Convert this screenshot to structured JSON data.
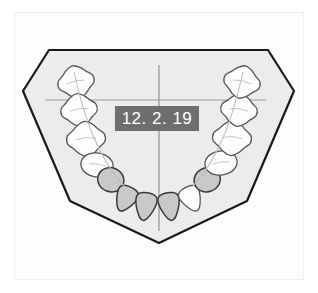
{
  "document": {
    "title": "Dental Arch Chart",
    "view": "occlusal",
    "arch": "mandibular"
  },
  "label": {
    "date_text": "12. 2. 19",
    "background_color": "#6e6e6e",
    "text_color": "#ffffff"
  },
  "colors": {
    "page_background": "#ffffff",
    "frame_border": "#f0f0f0",
    "model_fill": "#ececec",
    "model_stroke": "#1a1a1a",
    "tooth_fill_white": "#fdfdfd",
    "tooth_fill_shaded": "#c9c9c9",
    "tooth_stroke": "#555555",
    "tooth_stroke_dark": "#3a3a3a",
    "crosshair": "#9a9a9a",
    "arch_guide_line": "#bdbdbd"
  },
  "model_base": {
    "name": "cast-model-outline",
    "points": "49,50 268,50 294,91 247,201 159,243 70,201 23,91"
  },
  "crosshair": {
    "vertical": {
      "x": 159,
      "y1": 65,
      "y2": 231
    },
    "horizontal": {
      "y": 100,
      "x1": 45,
      "x2": 266
    }
  },
  "arch_guides": [
    {
      "name": "left-arch-guide",
      "d": "M 74,72 C 83,112 96,156 124,186"
    },
    {
      "name": "right-arch-guide",
      "d": "M 243,72 C 234,112 221,156 193,186"
    }
  ],
  "teeth": [
    {
      "id": "LL7",
      "name": "lower-left-second-molar",
      "shade": "white",
      "cx": 76,
      "cy": 82,
      "rx": 17,
      "ry": 15,
      "rot": -12,
      "shape": "molar"
    },
    {
      "id": "LL6",
      "name": "lower-left-first-molar",
      "shade": "white",
      "cx": 79,
      "cy": 110,
      "rx": 17,
      "ry": 15,
      "rot": -8,
      "shape": "molar"
    },
    {
      "id": "LL5",
      "name": "lower-left-second-premolar",
      "shade": "white",
      "cx": 86,
      "cy": 139,
      "rx": 18,
      "ry": 16,
      "rot": -4,
      "shape": "molar"
    },
    {
      "id": "LL4",
      "name": "lower-left-first-premolar",
      "shade": "white",
      "cx": 97,
      "cy": 165,
      "rx": 15,
      "ry": 13,
      "rot": 8,
      "shape": "premolar"
    },
    {
      "id": "LL3",
      "name": "lower-left-canine",
      "shade": "shaded",
      "cx": 110,
      "cy": 182,
      "rx": 13,
      "ry": 12,
      "rot": 20,
      "shape": "canine"
    },
    {
      "id": "LL2",
      "name": "lower-left-lateral-incisor",
      "shade": "shaded",
      "cx": 127,
      "cy": 196,
      "rx": 12,
      "ry": 13,
      "rot": 26,
      "shape": "incisor"
    },
    {
      "id": "LL1",
      "name": "lower-left-central-incisor",
      "shade": "shaded",
      "cx": 146,
      "cy": 203,
      "rx": 12,
      "ry": 14,
      "rot": 10,
      "shape": "incisor"
    },
    {
      "id": "LR1",
      "name": "lower-right-central-incisor",
      "shade": "shaded",
      "cx": 169,
      "cy": 203,
      "rx": 12,
      "ry": 14,
      "rot": -10,
      "shape": "incisor"
    },
    {
      "id": "LR2",
      "name": "lower-right-lateral-incisor",
      "shade": "white",
      "cx": 190,
      "cy": 196,
      "rx": 12,
      "ry": 13,
      "rot": -26,
      "shape": "incisor"
    },
    {
      "id": "LR3",
      "name": "lower-right-canine",
      "shade": "shaded",
      "cx": 208,
      "cy": 182,
      "rx": 13,
      "ry": 12,
      "rot": -20,
      "shape": "canine"
    },
    {
      "id": "LR4",
      "name": "lower-right-first-premolar",
      "shade": "white",
      "cx": 221,
      "cy": 163,
      "rx": 15,
      "ry": 13,
      "rot": -8,
      "shape": "premolar"
    },
    {
      "id": "LR5",
      "name": "lower-right-second-premolar",
      "shade": "white",
      "cx": 232,
      "cy": 138,
      "rx": 18,
      "ry": 16,
      "rot": 4,
      "shape": "molar"
    },
    {
      "id": "LR6",
      "name": "lower-right-first-molar",
      "shade": "white",
      "cx": 239,
      "cy": 110,
      "rx": 17,
      "ry": 15,
      "rot": 8,
      "shape": "molar"
    },
    {
      "id": "LR7",
      "name": "lower-right-second-molar",
      "shade": "white",
      "cx": 242,
      "cy": 82,
      "rx": 17,
      "ry": 15,
      "rot": 12,
      "shape": "molar"
    }
  ]
}
